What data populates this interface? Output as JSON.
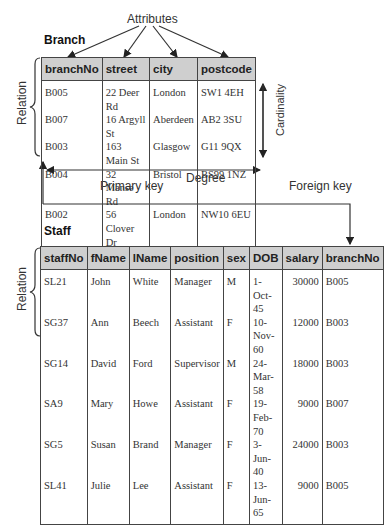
{
  "annotations": {
    "attributes": "Attributes",
    "relation_top": "Relation",
    "relation_bottom": "Relation",
    "cardinality": "Cardinality",
    "degree": "Degree",
    "primary_key": "Primary key",
    "foreign_key": "Foreign key"
  },
  "branch": {
    "title": "Branch",
    "columns": [
      "branchNo",
      "street",
      "city",
      "postcode"
    ],
    "rows": [
      [
        "B005",
        "22 Deer Rd",
        "London",
        "SW1 4EH"
      ],
      [
        "B007",
        "16 Argyll St",
        "Aberdeen",
        "AB2 3SU"
      ],
      [
        "B003",
        "163 Main St",
        "Glasgow",
        "G11 9QX"
      ],
      [
        "B004",
        "32 Manse Rd",
        "Bristol",
        "BS99 1NZ"
      ],
      [
        "B002",
        "56 Clover Dr",
        "London",
        "NW10 6EU"
      ]
    ]
  },
  "staff": {
    "title": "Staff",
    "columns": [
      "staffNo",
      "fName",
      "lName",
      "position",
      "sex",
      "DOB",
      "salary",
      "branchNo"
    ],
    "rows": [
      [
        "SL21",
        "John",
        "White",
        "Manager",
        "M",
        "1-Oct-45",
        "30000",
        "B005"
      ],
      [
        "SG37",
        "Ann",
        "Beech",
        "Assistant",
        "F",
        "10-Nov-60",
        "12000",
        "B003"
      ],
      [
        "SG14",
        "David",
        "Ford",
        "Supervisor",
        "M",
        "24-Mar-58",
        "18000",
        "B003"
      ],
      [
        "SA9",
        "Mary",
        "Howe",
        "Assistant",
        "F",
        "19-Feb-70",
        "9000",
        "B007"
      ],
      [
        "SG5",
        "Susan",
        "Brand",
        "Manager",
        "F",
        "3-Jun-40",
        "24000",
        "B003"
      ],
      [
        "SL41",
        "Julie",
        "Lee",
        "Assistant",
        "F",
        "13-Jun-65",
        "9000",
        "B005"
      ]
    ]
  }
}
